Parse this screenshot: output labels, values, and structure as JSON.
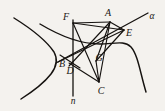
{
  "figure": {
    "canvas": {
      "width": 165,
      "height": 111
    },
    "background_color": "#f4f2ee",
    "ink_color": "#15120f",
    "points": [
      {
        "id": "F",
        "label": "F",
        "label_x": 66,
        "label_y": 17,
        "x": 73,
        "y": 23
      },
      {
        "id": "A",
        "label": "A",
        "label_x": 108,
        "label_y": 13,
        "x": 110,
        "y": 22
      },
      {
        "id": "E",
        "label": "E",
        "label_x": 129,
        "label_y": 33,
        "x": 124,
        "y": 30
      },
      {
        "id": "B",
        "label": "B",
        "label_x": 62,
        "label_y": 64,
        "x": 69,
        "y": 58
      },
      {
        "id": "D",
        "label": "D",
        "label_x": 70,
        "label_y": 71,
        "x": 73,
        "y": 66
      },
      {
        "id": "G",
        "label": "G",
        "label_x": 99,
        "label_y": 58,
        "x": 96,
        "y": 61
      },
      {
        "id": "C",
        "label": "C",
        "label_x": 101,
        "label_y": 91,
        "x": 99,
        "y": 82
      }
    ],
    "lines": [
      {
        "id": "alpha",
        "label": "α",
        "label_x": 152,
        "label_y": 17
      },
      {
        "id": "n",
        "label": "n",
        "label_x": 73,
        "label_y": 102
      }
    ],
    "curves": {
      "left_branch": "hyperbola branch opening left",
      "right_branch": "hyperbola branch opening right"
    },
    "chords": [
      "F-A",
      "F-E",
      "F-C",
      "A-E",
      "A-G",
      "A-C",
      "A-D",
      "E-G",
      "E-B",
      "G-C",
      "B-C",
      "B-D"
    ]
  }
}
